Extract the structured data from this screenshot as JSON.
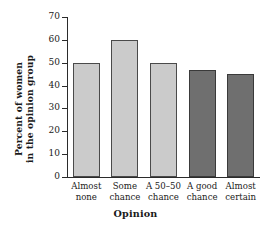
{
  "chart_data": {
    "type": "bar",
    "title": "",
    "categories": [
      "Almost none",
      "Some chance",
      "A 50–50 chance",
      "A good chance",
      "Almost certain"
    ],
    "category_lines": [
      [
        "Almost",
        "none"
      ],
      [
        "Some",
        "chance"
      ],
      [
        "A 50–50",
        "chance"
      ],
      [
        "A good",
        "chance"
      ],
      [
        "Almost",
        "certain"
      ]
    ],
    "values": [
      50,
      60,
      50,
      47,
      45
    ],
    "bar_colors": [
      "#cbcbcb",
      "#cbcbcb",
      "#cbcbcb",
      "#6f6f6f",
      "#6f6f6f"
    ],
    "xlabel": "Opinion",
    "ylabel": "Percent of women in the opinion group",
    "ylabel_lines": [
      "Percent of women",
      "in the opinion group"
    ],
    "ylim": [
      0,
      70
    ],
    "yticks": [
      0,
      10,
      20,
      30,
      40,
      50,
      60,
      70
    ],
    "ytick_labels": [
      "0",
      "10",
      "20",
      "30",
      "40",
      "50",
      "60",
      "70"
    ],
    "grid": false,
    "legend": null,
    "axis_color": "#2b2b2b",
    "bar_edge_color": "#4a4a4a",
    "background": "#ffffff"
  }
}
